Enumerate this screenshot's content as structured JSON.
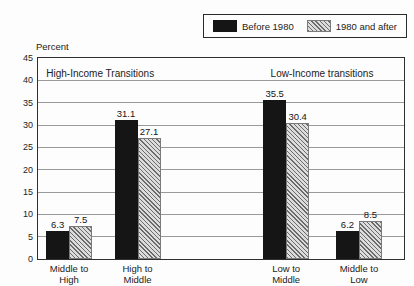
{
  "legend": {
    "position": "top-right",
    "items": [
      {
        "label": "Before 1980",
        "swatch": "solid-black"
      },
      {
        "label": "1980 and after",
        "swatch": "diagonal-hatch"
      }
    ]
  },
  "chart_data": {
    "type": "bar",
    "title": "",
    "ylabel": "Percent",
    "xlabel": "",
    "ylim": [
      0,
      45
    ],
    "ytick_step": 5,
    "grid": "horizontal",
    "legend_position": "top-right",
    "categories": [
      "Middle to High",
      "High to Middle",
      "Low to Middle",
      "Middle to Low"
    ],
    "category_lines": [
      "Middle to\nHigh",
      "High to\nMiddle",
      "Low to\nMiddle",
      "Middle to\nLow"
    ],
    "series": [
      {
        "name": "Before 1980",
        "style": "solid-black",
        "values": [
          6.3,
          31.1,
          35.5,
          6.2
        ]
      },
      {
        "name": "1980 and after",
        "style": "diagonal-hatch",
        "values": [
          7.5,
          27.1,
          30.4,
          8.5
        ]
      }
    ],
    "annotations": [
      {
        "text": "High-Income Transitions",
        "x_frac": 0.17,
        "y_px": 10
      },
      {
        "text": "Low-Income transitions",
        "x_frac": 0.776,
        "y_px": 10
      }
    ],
    "group_center_frac": [
      0.085,
      0.272,
      0.678,
      0.877
    ],
    "bar_width_px": 23,
    "colors": {
      "solid_bar": "#151515",
      "hatch_line": "#6b6b6b",
      "hatch_bg": "#dcdcdc",
      "gridline": "#9a9a9a"
    }
  }
}
